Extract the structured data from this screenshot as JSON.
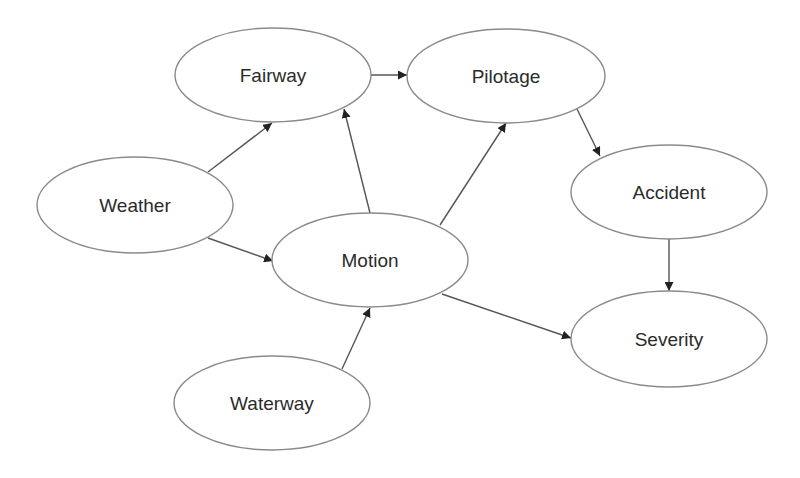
{
  "diagram": {
    "type": "directed-graph",
    "colors": {
      "background": "#ffffff",
      "node_stroke": "#8a8a8a",
      "edge": "#555555",
      "text": "#2b2b2b"
    },
    "nodes": [
      {
        "id": "fairway",
        "label": "Fairway",
        "cx": 273,
        "cy": 75,
        "rx": 98,
        "ry": 47
      },
      {
        "id": "pilotage",
        "label": "Pilotage",
        "cx": 506,
        "cy": 76,
        "rx": 99,
        "ry": 47
      },
      {
        "id": "weather",
        "label": "Weather",
        "cx": 135,
        "cy": 205,
        "rx": 98,
        "ry": 48
      },
      {
        "id": "accident",
        "label": "Accident",
        "cx": 669,
        "cy": 192,
        "rx": 98,
        "ry": 47
      },
      {
        "id": "motion",
        "label": "Motion",
        "cx": 370,
        "cy": 260,
        "rx": 98,
        "ry": 47
      },
      {
        "id": "severity",
        "label": "Severity",
        "cx": 669,
        "cy": 339,
        "rx": 98,
        "ry": 48
      },
      {
        "id": "waterway",
        "label": "Waterway",
        "cx": 272,
        "cy": 403,
        "rx": 98,
        "ry": 47
      }
    ],
    "edges": [
      {
        "from": "fairway",
        "to": "pilotage",
        "x1": 371,
        "y1": 75,
        "x2": 407,
        "y2": 75
      },
      {
        "from": "weather",
        "to": "fairway",
        "x1": 208,
        "y1": 172,
        "x2": 272,
        "y2": 123
      },
      {
        "from": "weather",
        "to": "motion",
        "x1": 208,
        "y1": 238,
        "x2": 273,
        "y2": 261
      },
      {
        "from": "motion",
        "to": "fairway",
        "x1": 370,
        "y1": 213,
        "x2": 344,
        "y2": 109
      },
      {
        "from": "motion",
        "to": "pilotage",
        "x1": 440,
        "y1": 225,
        "x2": 506,
        "y2": 123
      },
      {
        "from": "motion",
        "to": "severity",
        "x1": 442,
        "y1": 294,
        "x2": 571,
        "y2": 338
      },
      {
        "from": "waterway",
        "to": "motion",
        "x1": 342,
        "y1": 369,
        "x2": 370,
        "y2": 308
      },
      {
        "from": "pilotage",
        "to": "accident",
        "x1": 577,
        "y1": 109,
        "x2": 600,
        "y2": 156
      },
      {
        "from": "accident",
        "to": "severity",
        "x1": 669,
        "y1": 239,
        "x2": 669,
        "y2": 291
      }
    ]
  }
}
